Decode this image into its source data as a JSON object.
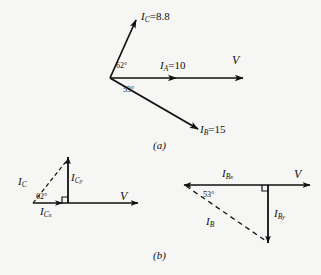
{
  "figure": {
    "title": "",
    "background_color": "#f6f6f4",
    "ink_color": "#111111",
    "panels": [
      {
        "id": "a",
        "caption": "(a)",
        "description": "Phasor diagram of three currents referenced to voltage V"
      },
      {
        "id": "b",
        "caption": "(b)",
        "description": "Resolution of I_C and I_B into rectangular components"
      }
    ]
  },
  "panel_a": {
    "caption": "(a)",
    "reference_label": "V",
    "phasors": [
      {
        "name": "I_C",
        "symbol": "I",
        "subscript": "C",
        "equals": "=",
        "magnitude": "8.8",
        "label_text": "I_C = 8.8",
        "angle_label": "62°",
        "angle_value": 62,
        "direction": "above-horizontal",
        "style": "solid"
      },
      {
        "name": "I_A",
        "symbol": "I",
        "subscript": "A",
        "equals": "=",
        "magnitude": "10",
        "label_text": "I_A = 10",
        "angle_label": "0°",
        "angle_value": 0,
        "direction": "along-horizontal",
        "style": "solid"
      },
      {
        "name": "I_B",
        "symbol": "I",
        "subscript": "B",
        "equals": "=",
        "magnitude": "15",
        "label_text": "I_B = 15",
        "angle_label": "53°",
        "angle_value": 53,
        "direction": "below-horizontal",
        "style": "solid"
      }
    ],
    "angles": [
      {
        "label": "62°",
        "between": "I_C and I_A"
      },
      {
        "label": "53°",
        "between": "I_A and I_B"
      }
    ]
  },
  "panel_b": {
    "caption": "(b)",
    "left_diagram": {
      "reference_label": "V",
      "resultant": {
        "symbol": "I",
        "subscript": "C",
        "label_text": "I_C",
        "style": "dashed"
      },
      "components": [
        {
          "symbol": "I",
          "subscript": "C",
          "subsubscript": "x",
          "label_text": "I_Cx",
          "orientation": "horizontal",
          "style": "solid"
        },
        {
          "symbol": "I",
          "subscript": "C",
          "subsubscript": "y",
          "label_text": "I_Cy",
          "orientation": "vertical-up",
          "style": "solid"
        }
      ],
      "angle_label": "62°",
      "angle_value": 62,
      "right_angle_marker": true
    },
    "right_diagram": {
      "reference_label": "V",
      "resultant": {
        "symbol": "I",
        "subscript": "B",
        "label_text": "I_B",
        "style": "dashed"
      },
      "components": [
        {
          "symbol": "I",
          "subscript": "B",
          "subsubscript": "x",
          "label_text": "I_Bx",
          "orientation": "horizontal",
          "style": "solid"
        },
        {
          "symbol": "I",
          "subscript": "B",
          "subsubscript": "y",
          "label_text": "I_By",
          "orientation": "vertical-down",
          "style": "solid"
        }
      ],
      "angle_label": "53°",
      "angle_value": 53,
      "right_angle_marker": true
    }
  },
  "text": {
    "I": "I",
    "V": "V",
    "sub_A": "A",
    "sub_B": "B",
    "sub_C": "C",
    "sub_x": "x",
    "sub_y": "y",
    "eq": "=",
    "mag_IA": "10",
    "mag_IB": "15",
    "mag_IC": "8.8",
    "ang62": "62°",
    "ang53": "53°",
    "cap_a": "(a)",
    "cap_b": "(b)"
  }
}
